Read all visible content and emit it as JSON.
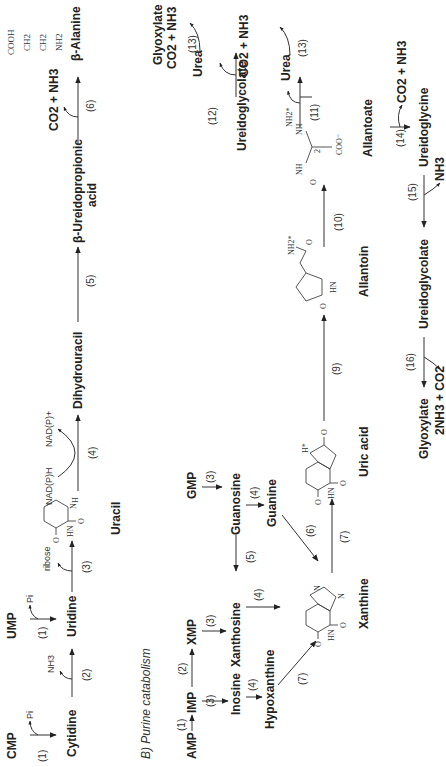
{
  "pyrimidine": {
    "cmp": "CMP",
    "ump": "UMP",
    "cytidine": "Cytidine",
    "uridine": "Uridine",
    "uracil": "Uracil",
    "dihydrouracil": "Dihydrouracil",
    "ureidopropionic_1": "β-Ureidopropionic",
    "ureidopropionic_2": "acid",
    "beta_alanine": "β-Alanine",
    "beta_alanine_struct": [
      "COOH",
      "CH2",
      "CH2",
      "NH2"
    ],
    "pi_1": "Pi",
    "pi_2": "Pi",
    "nh3": "NH3",
    "ribose": "ribose",
    "nadph": "NAD(P)H",
    "nadp": "NAD(P)+",
    "co2_nh3": "CO2 + NH3",
    "steps": {
      "s1a": "(1)",
      "s1b": "(1)",
      "s2": "(2)",
      "s3": "(3)",
      "s4": "(4)",
      "s5": "(5)",
      "s6": "(6)"
    }
  },
  "purine": {
    "section_title": "B) Purine catabolism",
    "amp": "AMP",
    "imp": "IMP",
    "xmp": "XMP",
    "gmp": "GMP",
    "inosine": "Inosine",
    "hypoxanthine": "Hypoxanthine",
    "xanthosine": "Xanthosine",
    "guanosine": "Guanosine",
    "guanine": "Guanine",
    "xanthine": "Xanthine",
    "uric_acid": "Uric acid",
    "allantoin": "Allantoin",
    "allantoate": "Allantoate",
    "ureidoglycolate_a": "Ureidoglycolate",
    "glyoxylate_a": "Glyoxylate",
    "urea_1": "Urea",
    "urea_2": "Urea",
    "co2_nh3_1": "CO2 + NH3",
    "co2_nh3_2": "CO2 + NH3",
    "co2_nh3_3": "CO2 + NH3",
    "ureidoglycine": "Ureidoglycine",
    "ureidoglycolate_b": "Ureidoglycolate",
    "glyoxylate_b": "Glyoxylate",
    "nh3": "NH3",
    "two_nh3_co2": "2NH3 + CO2",
    "steps": {
      "s1": "(1)",
      "s2": "(2)",
      "s3a": "(3)",
      "s3b": "(3)",
      "s3c": "(3)",
      "s4a": "(4)",
      "s4b": "(4)",
      "s4c": "(4)",
      "s5": "(5)",
      "s6": "(6)",
      "s7a": "(7)",
      "s7b": "(7)",
      "s9": "(9)",
      "s10": "(10)",
      "s11": "(11)",
      "s12": "(12)",
      "s13a": "(13)",
      "s13b": "(13)",
      "s14": "(14)",
      "s15": "(15)",
      "s16": "(16)"
    }
  }
}
